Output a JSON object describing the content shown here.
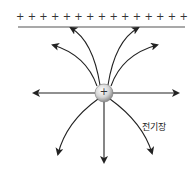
{
  "diagram": {
    "plate": {
      "charge_symbol": "+",
      "plus_count": 15
    },
    "point_charge": {
      "symbol": "+"
    },
    "field_label": "전기장",
    "colors": {
      "line": "#222222",
      "plate": "#555555",
      "charge_fill": "#d8d8d8"
    }
  }
}
